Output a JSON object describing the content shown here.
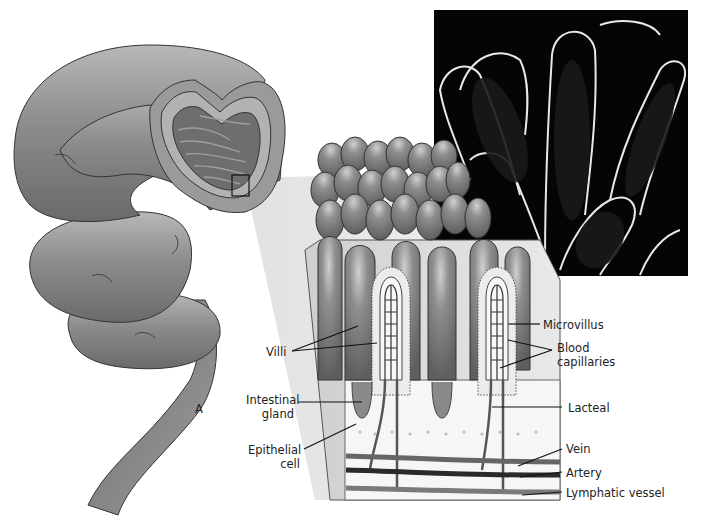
{
  "figure": {
    "panel_letter": "A",
    "parts": {
      "intestine": "Small intestine (coiled, cut section showing circular folds)",
      "inset_box": "Magnified region marker",
      "villi_block": "Cross-section block of intestinal wall with villi",
      "micrograph": "Scanning electron micrograph of villi"
    },
    "labels": {
      "villi": "Villi",
      "intestinal_gland_1": "Intestinal",
      "intestinal_gland_2": "gland",
      "epithelial_cell_1": "Epithelial",
      "epithelial_cell_2": "cell",
      "microvillus": "Microvillus",
      "blood_capillaries_1": "Blood",
      "blood_capillaries_2": "capillaries",
      "lacteal": "Lacteal",
      "vein": "Vein",
      "artery": "Artery",
      "lymphatic_vessel": "Lymphatic vessel"
    },
    "colors": {
      "tissue_mid": "#8a8a8a",
      "tissue_dark": "#555555",
      "tissue_light": "#c8c8c8",
      "epithelium": "#e6e6e6",
      "micrograph_bg": "#050505",
      "leader_line": "#111111"
    }
  }
}
